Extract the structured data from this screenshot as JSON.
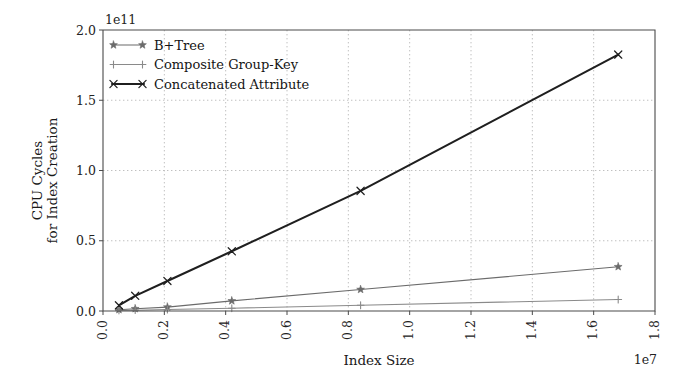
{
  "chart_data": {
    "type": "line",
    "title": "",
    "xlabel": "Index Size",
    "ylabel": "CPU Cycles\nfor Index Creation",
    "ylabel_line1": "CPU Cycles",
    "ylabel_line2": "for Index Creation",
    "x_offset_text": "1e7",
    "y_offset_text": "1e11",
    "x_scale": 10000000,
    "y_scale": 100000000000,
    "xlim": [
      0.0,
      1.8
    ],
    "ylim": [
      0.0,
      2.0
    ],
    "xticks": [
      "0.0",
      "0.2",
      "0.4",
      "0.6",
      "0.8",
      "1.0",
      "1.2",
      "1.4",
      "1.6",
      "1.8"
    ],
    "xtick_values": [
      0.0,
      0.2,
      0.4,
      0.6,
      0.8,
      1.0,
      1.2,
      1.4,
      1.6,
      1.8
    ],
    "yticks": [
      "0.0",
      "0.5",
      "1.0",
      "1.5",
      "2.0"
    ],
    "ytick_values": [
      0.0,
      0.5,
      1.0,
      1.5,
      2.0
    ],
    "grid": true,
    "grid_style": "dotted",
    "legend_position": "upper left",
    "legend_frame": false,
    "x": [
      0.052,
      0.105,
      0.21,
      0.42,
      0.84,
      1.68
    ],
    "series": [
      {
        "name": "B+Tree",
        "marker": "star",
        "color": "#6b6b6b",
        "values": [
          0.009,
          0.016,
          0.028,
          0.072,
          0.153,
          0.315
        ]
      },
      {
        "name": "Composite Group-Key",
        "marker": "plus",
        "color": "#8a8a8a",
        "values": [
          0.004,
          0.006,
          0.01,
          0.02,
          0.041,
          0.082
        ]
      },
      {
        "name": "Concatenated Attribute",
        "marker": "x",
        "color": "#1f1f1f",
        "values": [
          0.04,
          0.108,
          0.214,
          0.425,
          0.855,
          1.825
        ]
      }
    ]
  },
  "figure": {
    "background": "#ffffff",
    "axes_color": "#4a4a4a",
    "grid_color": "#b9b9b9"
  }
}
